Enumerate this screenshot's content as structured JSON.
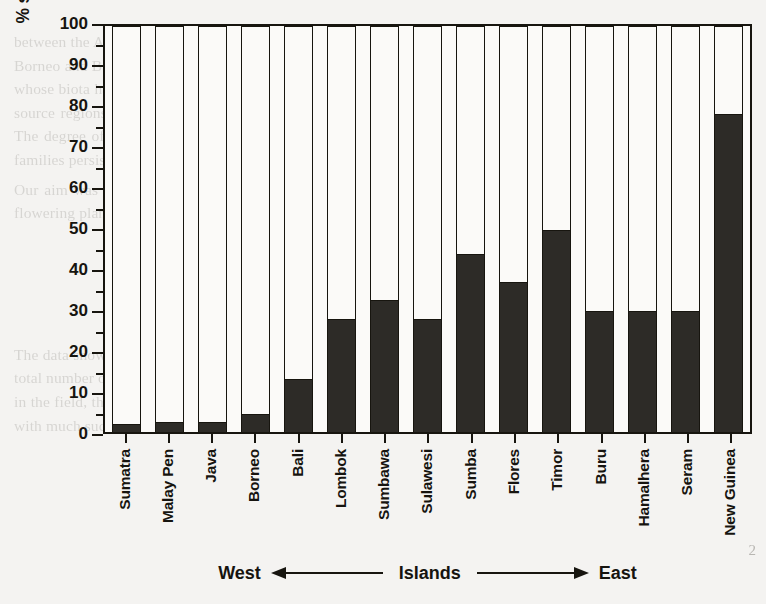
{
  "chart_data": {
    "type": "bar",
    "title": "",
    "xlabel": "Islands",
    "ylabel": "% species from Australian to Asian families",
    "ylim": [
      0,
      100
    ],
    "ytick_step": 10,
    "yminor_step": 5,
    "grid": false,
    "legend": null,
    "orientation": "vertical",
    "bar_color": "#2d2b27",
    "outline_color": "#17150f",
    "categories": [
      "Sumatra",
      "Malay Pen",
      "Java",
      "Borneo",
      "Bali",
      "Lombok",
      "Sumbawa",
      "Sulawesi",
      "Sumba",
      "Flores",
      "Timor",
      "Buru",
      "Hamalhera",
      "Seram",
      "New Guinea"
    ],
    "values": [
      2,
      2.5,
      2.5,
      4.5,
      13,
      28,
      32.5,
      28,
      44,
      37,
      50,
      30,
      30,
      30,
      78.5
    ],
    "yticks": [
      0,
      10,
      20,
      30,
      40,
      50,
      60,
      70,
      80,
      90,
      100
    ],
    "ytick_labels": [
      "0",
      "10",
      "20",
      "30",
      "40",
      "50",
      "60",
      "70",
      "80",
      "90",
      "100"
    ],
    "annotations": {
      "west": "West",
      "islands": "Islands",
      "east": "East",
      "arrow_left": "left-arrow",
      "arrow_right": "right-arrow"
    }
  },
  "page": {
    "number": "2",
    "bg_text_top": [
      "between the Australian and Asian plates. The shallow discontinuity of the Sunda shelf islands include Sumatra, Java, Borneo and Bali which are of a composition of the Asian continental margin. To the east lie the islands of Wallacea, whose biota has long been recognized as a mixture of Asian and Australian lineages. The transition between the two source regions is gradual rather than abrupt, and the relative contribution of each element varies along a gradient. The degree of the Australian element increases markedly once the Wallace line is crossed, yet a number of Asian families persist all the way east to New Guinea.",
      "Our aim was to quantify this pattern across the island chain by measuring, for each island, the proportion of the flowering plant species belonging to families of Australian versus Asian origin."
    ],
    "bg_text_bottom": [
      "The data show that the proportion of Australian species rises steadily from west to east. The values shown are of the total number of native species, if the relative numbers of the two elements are weighted by the number of individuals in the field, the overall picture is similar. The basis of the analysis is collected in table two. The basic material deals with much such"
    ]
  }
}
